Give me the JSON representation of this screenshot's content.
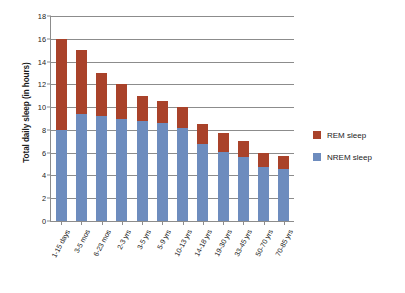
{
  "chart_data": {
    "type": "bar",
    "subtype": "stacked-bar",
    "title": "",
    "xlabel": "",
    "ylabel": "Total daily sleep (in hours)",
    "ylim": [
      0,
      18
    ],
    "yticks": [
      0,
      2,
      4,
      6,
      8,
      10,
      12,
      14,
      16,
      18
    ],
    "ytick_labels": [
      "0",
      "2",
      "4",
      "6",
      "8",
      "10",
      "12",
      "14",
      "16",
      "18"
    ],
    "grid": true,
    "grid_axis": "y",
    "legend_position": "right",
    "categories": [
      "1-15 days",
      "3-5 mos",
      "6-23 mos",
      "2-3 yrs",
      "3-5 yrs",
      "5-9 yrs",
      "10-13 yrs",
      "14-18 yrs",
      "19-30 yrs",
      "33-45 yrs",
      "50-70 yrs",
      "70-85 yrs"
    ],
    "series": [
      {
        "name": "NREM sleep",
        "color": "#6D8CBE",
        "values": [
          8.0,
          9.4,
          9.2,
          9.0,
          8.8,
          8.6,
          8.2,
          6.8,
          6.1,
          5.6,
          4.7,
          4.6
        ]
      },
      {
        "name": "REM sleep",
        "color": "#A9422A",
        "values": [
          8.0,
          5.6,
          3.8,
          3.0,
          2.2,
          1.9,
          1.8,
          1.7,
          1.6,
          1.4,
          1.3,
          1.1
        ]
      }
    ],
    "totals": [
      16.0,
      15.0,
      13.0,
      12.0,
      11.0,
      10.5,
      10.0,
      8.5,
      7.7,
      7.0,
      6.0,
      5.7
    ],
    "stack_order_bottom_to_top": [
      "NREM sleep",
      "REM sleep"
    ]
  },
  "legend": {
    "items": [
      {
        "label": "REM sleep",
        "color": "#A9422A"
      },
      {
        "label": "NREM sleep",
        "color": "#6D8CBE"
      }
    ]
  },
  "axes": {
    "y_title": "Total daily sleep (in hours)"
  },
  "colors": {
    "rem": "#A9422A",
    "nrem": "#6D8CBE",
    "axis": "#8c8c8c",
    "text": "#1b1b1b",
    "background": "#ffffff"
  }
}
